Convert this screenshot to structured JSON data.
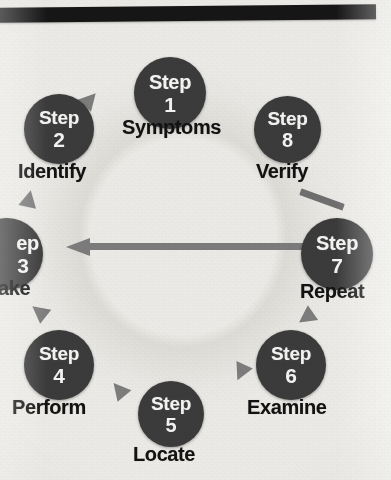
{
  "diagram": {
    "type": "cycle",
    "step_word": "Step",
    "colors": {
      "page_background": "#ecebe7",
      "top_bar": "#161616",
      "node_fill": "#3b3b3b",
      "node_text": "#f4f4f2",
      "caption_text": "#121212",
      "arrow": "#7c7c7c",
      "ring": "#dedcd7"
    },
    "steps": [
      {
        "number": "1",
        "label": "Symptoms",
        "position": "top-center"
      },
      {
        "number": "2",
        "label": "Identify",
        "position": "upper-left"
      },
      {
        "number": "3",
        "label": "ake",
        "position": "left",
        "clipped": "true"
      },
      {
        "number": "4",
        "label": "Perform",
        "position": "lower-left"
      },
      {
        "number": "5",
        "label": "Locate",
        "position": "bottom-center"
      },
      {
        "number": "6",
        "label": "Examine",
        "position": "lower-right"
      },
      {
        "number": "7",
        "label": "Repeat",
        "position": "right"
      },
      {
        "number": "8",
        "label": "Verify",
        "position": "upper-right"
      }
    ],
    "step3_clipped_word": "ep",
    "connectors": {
      "center_arrow_direction": "left",
      "arrowhead_count": "6"
    }
  }
}
